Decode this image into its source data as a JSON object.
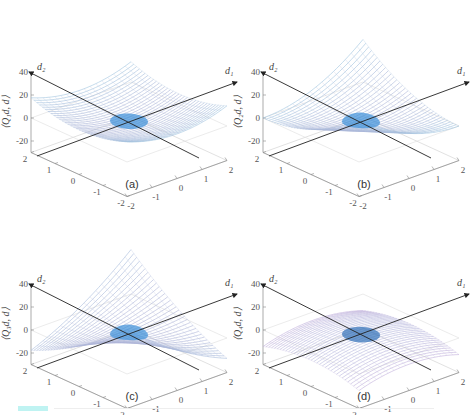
{
  "figure": {
    "panels": [
      {
        "id": "a",
        "caption": "(a)",
        "zlabel": "⟨Q₁d, d⟩",
        "shape": "convex-bowl-with-peak"
      },
      {
        "id": "b",
        "caption": "(b)",
        "zlabel": "⟨Q₂d, d⟩",
        "shape": "saddle-ridge"
      },
      {
        "id": "c",
        "caption": "(c)",
        "zlabel": "⟨Q₃d, d⟩",
        "shape": "saddle-cross"
      },
      {
        "id": "d",
        "caption": "(d)",
        "zlabel": "⟨Q₄d, d⟩",
        "shape": "concave-dome"
      }
    ],
    "axis_labels": {
      "d1": "d₁",
      "d2": "d₂"
    },
    "zticks": [
      "40",
      "20",
      "0",
      "-20"
    ],
    "xticks": [
      "-2",
      "-1",
      "0",
      "1",
      "2"
    ],
    "yticks": [
      "2",
      "1",
      "0",
      "-1",
      "-2"
    ],
    "colors": {
      "cyan": "#7fe6f2",
      "blue": "#3a8fd8",
      "pink": "#e07ab8",
      "magenta": "#c0488e",
      "axis": "#333333",
      "grid": "#cccccc"
    }
  },
  "chart_data": [
    {
      "type": "surface",
      "title": "(a)",
      "zlabel": "<Q1 d, d>",
      "xlabel": "d1",
      "ylabel": "d2",
      "xlim": [
        -2,
        2
      ],
      "ylim": [
        -2,
        2
      ],
      "zlim": [
        -30,
        40
      ],
      "zticks": [
        -20,
        0,
        20,
        40
      ],
      "xticks": [
        -2,
        -1,
        0,
        1,
        2
      ],
      "yticks": [
        -2,
        -1,
        0,
        1,
        2
      ],
      "description": "Positive-definite quadratic form; upward bowl, min 0 at origin, max ~40 at corners"
    },
    {
      "type": "surface",
      "title": "(b)",
      "zlabel": "<Q2 d, d>",
      "xlabel": "d1",
      "ylabel": "d2",
      "xlim": [
        -2,
        2
      ],
      "ylim": [
        -2,
        2
      ],
      "zlim": [
        -30,
        40
      ],
      "zticks": [
        -20,
        0,
        20,
        40
      ],
      "xticks": [
        -2,
        -1,
        0,
        1,
        2
      ],
      "yticks": [
        -2,
        -1,
        0,
        1,
        2
      ],
      "description": "Positive semi-definite form; valley along one direction at 0, rising to ~40"
    },
    {
      "type": "surface",
      "title": "(c)",
      "zlabel": "<Q3 d, d>",
      "xlabel": "d1",
      "ylabel": "d2",
      "xlim": [
        -2,
        2
      ],
      "ylim": [
        -2,
        2
      ],
      "zlim": [
        -30,
        40
      ],
      "zticks": [
        -20,
        0,
        20,
        40
      ],
      "xticks": [
        -2,
        -1,
        0,
        1,
        2
      ],
      "yticks": [
        -2,
        -1,
        0,
        1,
        2
      ],
      "description": "Indefinite form; saddle, rising to ~40 along one diagonal and down to ~-20 along other"
    },
    {
      "type": "surface",
      "title": "(d)",
      "zlabel": "<Q4 d, d>",
      "xlabel": "d1",
      "ylabel": "d2",
      "xlim": [
        -2,
        2
      ],
      "ylim": [
        -2,
        2
      ],
      "zlim": [
        -30,
        40
      ],
      "zticks": [
        -20,
        0,
        20,
        40
      ],
      "xticks": [
        -2,
        -1,
        0,
        1,
        2
      ],
      "yticks": [
        -2,
        -1,
        0,
        1,
        2
      ],
      "description": "Negative-definite form; downward dome, max 0 at origin, min ~-30 at corners"
    }
  ]
}
